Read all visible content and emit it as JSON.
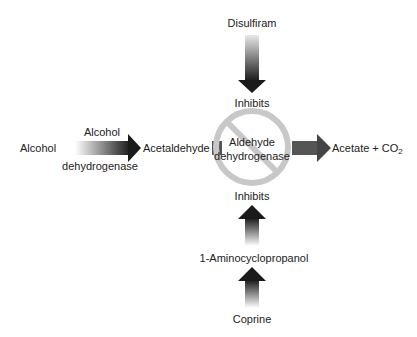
{
  "diagram": {
    "nodes": {
      "alcohol": "Alcohol",
      "enzyme1_line1": "Alcohol",
      "enzyme1_line2": "dehydrogenase",
      "acetaldehyde": "Acetaldehyde",
      "enzyme2_line1": "Aldehyde",
      "enzyme2_line2": "dehydrogenase",
      "product_main": "Acetate + CO",
      "product_sub": "2",
      "disulfiram": "Disulfiram",
      "inhibits_top": "Inhibits",
      "inhibits_bottom": "Inhibits",
      "aminocyclopropanol": "1-Aminocyclopropanol",
      "coprine": "Coprine"
    },
    "edges": [
      {
        "from": "Alcohol",
        "to": "Acetaldehyde",
        "label": "Alcohol dehydrogenase"
      },
      {
        "from": "Acetaldehyde",
        "to": "Acetate + CO2",
        "label": "Aldehyde dehydrogenase"
      },
      {
        "from": "Disulfiram",
        "to": "Aldehyde dehydrogenase",
        "label": "Inhibits"
      },
      {
        "from": "Coprine",
        "to": "1-Aminocyclopropanol",
        "label": ""
      },
      {
        "from": "1-Aminocyclopropanol",
        "to": "Aldehyde dehydrogenase",
        "label": "Inhibits"
      }
    ],
    "colors": {
      "arrow_dark": "#1a1a1a",
      "arrow_light": "#ffffff",
      "prohibition_circle": "#c8c8c8",
      "block_gray": "#555555"
    }
  }
}
